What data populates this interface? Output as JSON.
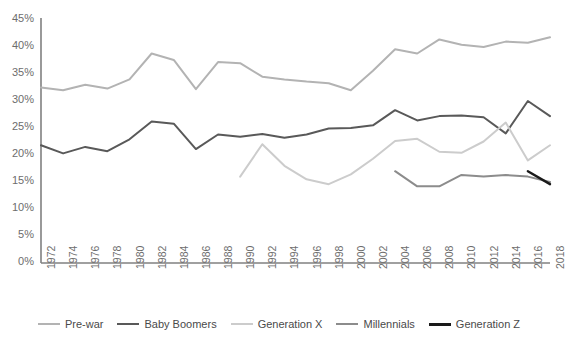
{
  "chart_data": {
    "type": "line",
    "title": "",
    "subtitle": "",
    "xlabel": "",
    "ylabel": "",
    "xlim": [
      1972,
      2018
    ],
    "ylim": [
      0,
      45
    ],
    "grid": false,
    "legend_position": "bottom",
    "y_tick_labels": [
      "0%",
      "5%",
      "10%",
      "15%",
      "20%",
      "25%",
      "30%",
      "35%",
      "40%",
      "45%"
    ],
    "y_tick_values": [
      0,
      5,
      10,
      15,
      20,
      25,
      30,
      35,
      40,
      45
    ],
    "x_tick_labels": [
      "1972",
      "1974",
      "1976",
      "1978",
      "1980",
      "1982",
      "1984",
      "1986",
      "1988",
      "1990",
      "1992",
      "1994",
      "1996",
      "1998",
      "2000",
      "2002",
      "2004",
      "2006",
      "2008",
      "2010",
      "2012",
      "2014",
      "2016",
      "2018"
    ],
    "x": [
      1972,
      1974,
      1976,
      1978,
      1980,
      1982,
      1984,
      1986,
      1988,
      1990,
      1992,
      1994,
      1996,
      1998,
      2000,
      2002,
      2004,
      2006,
      2008,
      2010,
      2012,
      2014,
      2016,
      2018
    ],
    "series": [
      {
        "name": "Pre-war",
        "color": "#b3b3b3",
        "width": 2,
        "x": [
          1972,
          1974,
          1976,
          1978,
          1980,
          1982,
          1984,
          1986,
          1988,
          1990,
          1992,
          1994,
          1996,
          1998,
          2000,
          2002,
          2004,
          2006,
          2008,
          2010,
          2012,
          2014,
          2016,
          2018
        ],
        "values": [
          32.5,
          32.0,
          33.0,
          32.3,
          34.0,
          38.8,
          37.6,
          32.2,
          37.2,
          37.0,
          34.5,
          34.0,
          33.6,
          33.3,
          32.0,
          35.6,
          39.6,
          38.8,
          41.4,
          40.4,
          40.0,
          41.0,
          40.8,
          41.8
        ]
      },
      {
        "name": "Baby Boomers",
        "color": "#595959",
        "width": 2,
        "x": [
          1972,
          1974,
          1976,
          1978,
          1980,
          1982,
          1984,
          1986,
          1988,
          1990,
          1992,
          1994,
          1996,
          1998,
          2000,
          2002,
          2004,
          2006,
          2008,
          2010,
          2012,
          2014,
          2016,
          2018
        ],
        "values": [
          21.8,
          20.3,
          21.5,
          20.7,
          22.9,
          26.2,
          25.8,
          21.1,
          23.8,
          23.4,
          23.9,
          23.2,
          23.8,
          24.9,
          25.0,
          25.5,
          28.3,
          26.4,
          27.2,
          27.3,
          27.0,
          24.0,
          30.0,
          27.2
        ]
      },
      {
        "name": "Generation X",
        "color": "#cccccc",
        "width": 2,
        "x": [
          1990,
          1992,
          1994,
          1996,
          1998,
          2000,
          2002,
          2004,
          2006,
          2008,
          2010,
          2012,
          2014,
          2016,
          2018
        ],
        "values": [
          16.0,
          22.0,
          18.0,
          15.5,
          14.6,
          16.4,
          19.3,
          22.6,
          23.0,
          20.6,
          20.4,
          22.5,
          26.0,
          19.0,
          21.8
        ]
      },
      {
        "name": "Millennials",
        "color": "#8c8c8c",
        "width": 2,
        "x": [
          2004,
          2006,
          2008,
          2010,
          2012,
          2014,
          2016,
          2018
        ],
        "values": [
          17.0,
          14.2,
          14.2,
          16.3,
          16.0,
          16.3,
          16.0,
          15.0
        ]
      },
      {
        "name": "Generation Z",
        "color": "#1a1a1a",
        "width": 2.4,
        "x": [
          2016,
          2018
        ],
        "values": [
          17.0,
          14.6
        ]
      }
    ]
  },
  "axis": {
    "line_color": "#808080"
  }
}
